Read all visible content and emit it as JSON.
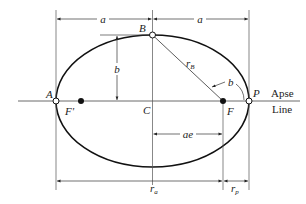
{
  "diagram": {
    "points": {
      "A": "A",
      "B": "B",
      "C": "C",
      "F": "F",
      "F_prime": "F'",
      "P": "P"
    },
    "dimensions": {
      "semi_major_left": "a",
      "semi_major_right": "a",
      "semi_minor": "b",
      "focal_offset": "ae",
      "radius_b": "r",
      "radius_b_sub": "B",
      "angle_b": "b",
      "apoapsis_radius": "r",
      "apoapsis_sub": "a",
      "periapsis_radius": "r",
      "periapsis_sub": "p"
    },
    "axis_label": {
      "line1": "Apse",
      "line2": "Line"
    },
    "colors": {
      "stroke": "#111111",
      "dim_line": "#333333"
    }
  }
}
